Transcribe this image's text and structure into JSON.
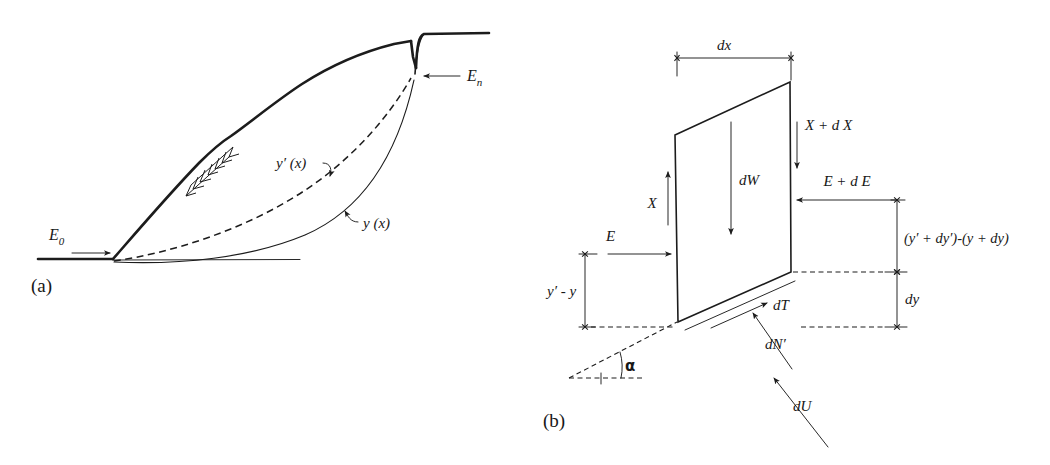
{
  "figure": {
    "kind": "two-panel engineering diagram",
    "background_color": "#ffffff",
    "ink_color": "#1c1c1c"
  },
  "panel_a": {
    "tag": "(a)",
    "description": "Slope cross-section with slip surfaces",
    "labels": {
      "E0": "E",
      "E0_sub": "0",
      "En": "E",
      "En_sub": "n",
      "y_prime_of_x": "y′ (x)",
      "y_of_x": "y (x)"
    },
    "curves": [
      {
        "name": "ground-surface",
        "style": "thick-solid"
      },
      {
        "name": "y-prime-curve",
        "style": "dashed"
      },
      {
        "name": "y-curve",
        "style": "thin-solid"
      },
      {
        "name": "base-line",
        "style": "thick-solid"
      }
    ],
    "annotations": [
      {
        "name": "hatching",
        "style": "slope-hatch-ticks"
      },
      {
        "name": "E0-arrow",
        "direction": "right"
      },
      {
        "name": "En-arrow",
        "direction": "left"
      },
      {
        "name": "y-prime-leader",
        "direction": "to-dashed-curve"
      },
      {
        "name": "y-leader",
        "direction": "to-thin-curve"
      }
    ]
  },
  "panel_b": {
    "tag": "(b)",
    "description": "Free body diagram of a vertical slice",
    "labels": {
      "dx": "dx",
      "dy": "dy",
      "dW": "dW",
      "X": "X",
      "X_plus_dX": "X + d X",
      "E": "E",
      "E_plus_dE": "E + d E",
      "height_diff": "(y′ + dy′)-(y + dy)",
      "y_prime_minus_y": "y′ - y",
      "dT": "dT",
      "dN_prime": "dN′",
      "dU": "dU",
      "alpha": "α"
    },
    "forces": [
      {
        "name": "X",
        "label": "X",
        "direction": "up",
        "side": "left"
      },
      {
        "name": "X-plus-dX",
        "label": "X + d X",
        "direction": "down",
        "side": "right"
      },
      {
        "name": "E",
        "label": "E",
        "direction": "right",
        "side": "left"
      },
      {
        "name": "E-plus-dE",
        "label": "E + d E",
        "direction": "left",
        "side": "right"
      },
      {
        "name": "dW",
        "label": "dW",
        "direction": "down",
        "side": "center"
      },
      {
        "name": "dT",
        "label": "dT",
        "direction": "up-right",
        "side": "base"
      },
      {
        "name": "dN-prime",
        "label": "dN′",
        "direction": "up-left",
        "side": "base"
      },
      {
        "name": "dU",
        "label": "dU",
        "direction": "up-left",
        "side": "base"
      }
    ],
    "dimensions": [
      {
        "name": "dx",
        "label": "dx",
        "orientation": "horizontal",
        "position": "top"
      },
      {
        "name": "dy",
        "label": "dy",
        "orientation": "vertical",
        "position": "right-lower"
      },
      {
        "name": "height-difference",
        "label": "(y′ + dy′)-(y + dy)",
        "orientation": "vertical",
        "position": "right-upper"
      },
      {
        "name": "y-prime-minus-y",
        "label": "y′ - y",
        "orientation": "vertical",
        "position": "left"
      }
    ],
    "angle": {
      "name": "alpha",
      "label": "α",
      "between": "base-of-slice and horizontal"
    }
  }
}
